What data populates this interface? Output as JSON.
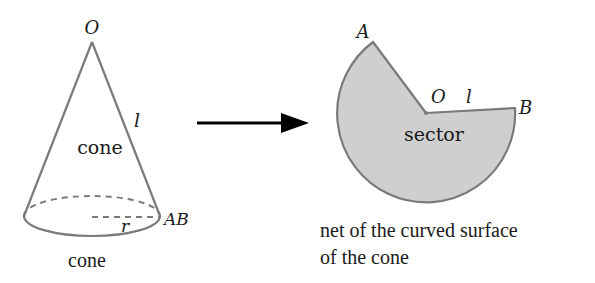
{
  "cone": {
    "apex_label": "O",
    "slant_label": "l",
    "body_label": "cone",
    "radius_label": "r",
    "base_point_label": "AB",
    "caption": "cone",
    "colors": {
      "outline": "#7a7a7a",
      "dashed": "#7a7a7a"
    }
  },
  "arrow": {
    "color": "#000000"
  },
  "sector": {
    "point_a_label": "A",
    "center_label": "O",
    "radius_label": "l",
    "point_b_label": "B",
    "body_label": "sector",
    "caption_line1": "net of the curved surface",
    "caption_line2": "of the cone",
    "colors": {
      "fill": "#cfcfcf",
      "outline": "#7a7a7a"
    }
  }
}
